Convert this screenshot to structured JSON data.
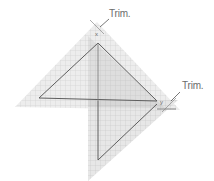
{
  "diagram": {
    "labels": {
      "trim_top": "Trim.",
      "trim_right": "Trim.",
      "vertex_top": "x",
      "vertex_right": "y"
    },
    "colors": {
      "ruler_fill": "#e8e8e8",
      "grid_line": "#c8c8c8",
      "outline": "#6a6a6a",
      "label": "#6b6b6b"
    }
  }
}
